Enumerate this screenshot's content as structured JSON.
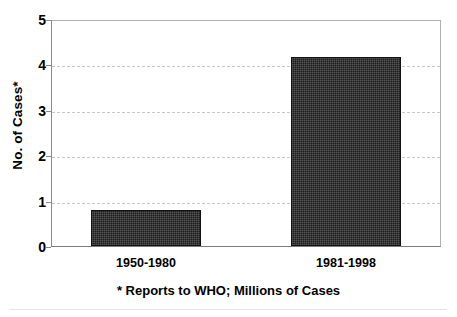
{
  "chart_data": {
    "type": "bar",
    "title": "",
    "subtitle": "",
    "categories": [
      "1950-1980",
      "1981-1998"
    ],
    "values": [
      0.8,
      4.2
    ],
    "series": [
      {
        "name": "No. of Cases",
        "values": [
          0.8,
          4.2
        ]
      }
    ],
    "xlabel": "",
    "ylabel": "No. of Cases*",
    "ylim": [
      0,
      5
    ],
    "yticks": [
      0,
      1,
      2,
      3,
      4,
      5
    ],
    "ytick_labels": [
      "0",
      "1",
      "2",
      "3",
      "4",
      "5"
    ],
    "grid": true,
    "grid_axis": "y",
    "grid_style": "dashed",
    "legend": false,
    "legend_position": "none",
    "annotations": [
      "* Reports to WHO; Millions of Cases"
    ],
    "bar_color": "#1c1c1c",
    "grid_color": "#c8c8c8",
    "axis_color": "#8a8a8a",
    "background_color": "#ffffff"
  },
  "axes": {
    "y_title": "No. of Cases*",
    "ticks": [
      {
        "label": "5",
        "value": 5
      },
      {
        "label": "4",
        "value": 4
      },
      {
        "label": "3",
        "value": 3
      },
      {
        "label": "2",
        "value": 2
      },
      {
        "label": "1",
        "value": 1
      },
      {
        "label": "0",
        "value": 0
      }
    ]
  },
  "bars": [
    {
      "category": "1950-1980",
      "value": 0.8
    },
    {
      "category": "1981-1998",
      "value": 4.2
    }
  ],
  "footnote": {
    "text": "* Reports to WHO; Millions of Cases"
  }
}
